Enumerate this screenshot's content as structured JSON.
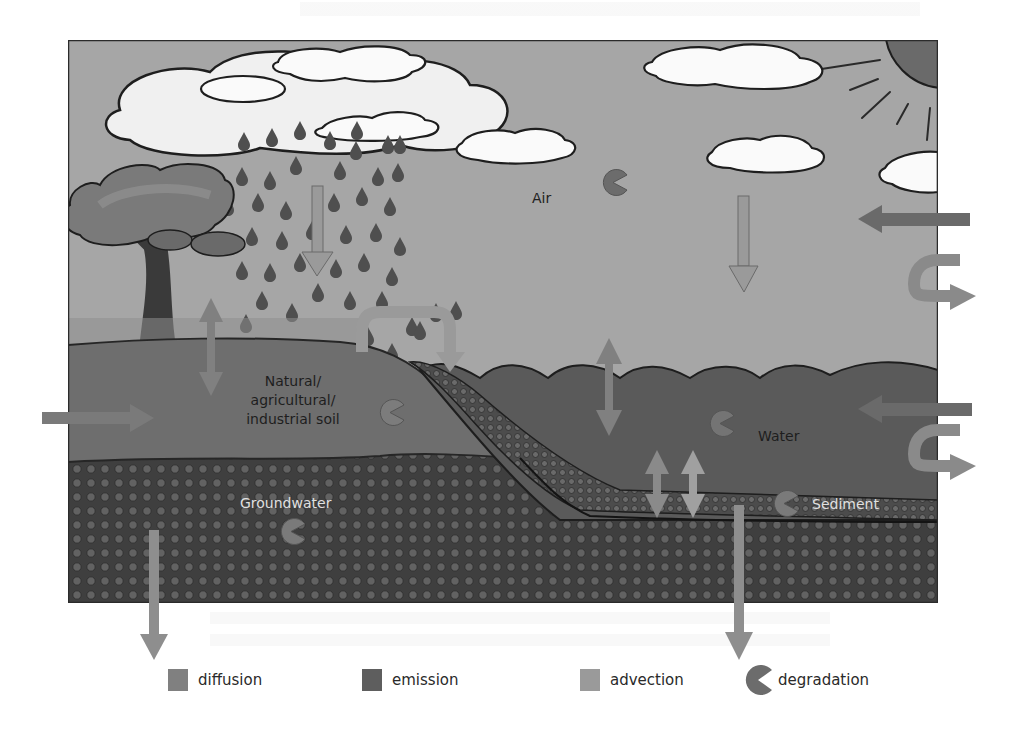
{
  "diagram": {
    "title": "",
    "compartments": {
      "air": "Air",
      "water": "Water",
      "sediment": "Sediment",
      "soil": "Natural/ agricultural/ industrial soil",
      "soil_lines": [
        "Natural/",
        "agricultural/",
        "industrial soil"
      ],
      "groundwater": "Groundwater"
    },
    "processes": {
      "diffusion": [
        "air-soil",
        "air-water",
        "water-sediment"
      ],
      "emission": [
        "into-soil",
        "into-water",
        "into-air"
      ],
      "advection": [
        "rain deposition",
        "air deposition",
        "runoff soil-to-water",
        "air outflow",
        "water outflow",
        "soil leaching",
        "sediment burial"
      ],
      "degradation": [
        "air",
        "soil",
        "water",
        "sediment",
        "groundwater"
      ]
    },
    "colors": {
      "frame": "#2b2b2b",
      "sky": "#a6a6a6",
      "cloud": "#f2f2f2",
      "cloud_outline": "#1e1e1e",
      "sun": "#6a6a6a",
      "soil": "#6e6e6e",
      "water": "#5a5a5a",
      "groundwater": "#3f3f3f",
      "pore": "#626262",
      "diffusion": "#808080",
      "emission": "#5e5e5e",
      "advection": "#9a9a9a",
      "degradation": "#6c6c6c",
      "raindrop": "#4f4f4f",
      "tree_trunk": "#3a3a3a",
      "tree_crown": "#7a7a7a"
    }
  },
  "legend": {
    "items": [
      {
        "label": "diffusion",
        "icon": "square-swatch",
        "color": "#808080"
      },
      {
        "label": "emission",
        "icon": "square-swatch",
        "color": "#5e5e5e"
      },
      {
        "label": "advection",
        "icon": "square-swatch",
        "color": "#9a9a9a"
      },
      {
        "label": "degradation",
        "icon": "pacman-icon",
        "color": "#6c6c6c"
      }
    ]
  }
}
